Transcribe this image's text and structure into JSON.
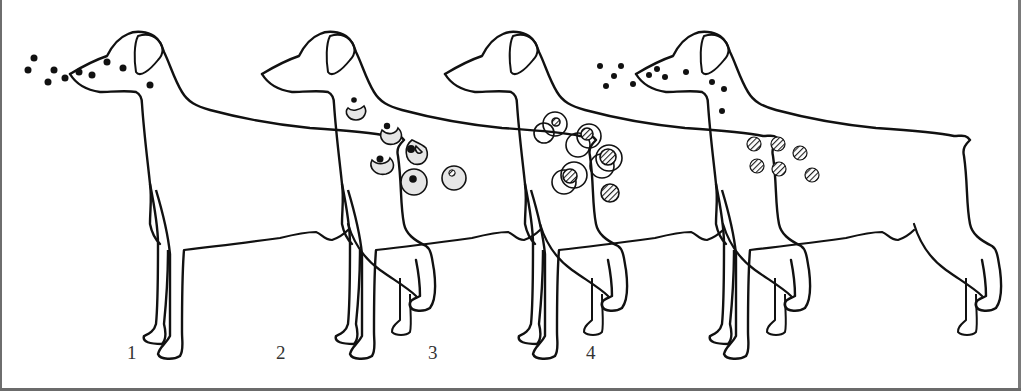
{
  "figure": {
    "stage_labels": [
      "1",
      "2",
      "3",
      "4"
    ],
    "colors": {
      "outline": "#111111",
      "cell_fill": "#e6e6e6",
      "hatch": "#222222",
      "background": "#ffffff"
    },
    "stages": [
      {
        "label": "1",
        "content": "dots (particles) in front of and on the muzzle"
      },
      {
        "label": "2",
        "content": "kidney-shaped cells engulfing dark particles; round cells with nuclei"
      },
      {
        "label": "3",
        "content": "overlapping open circles with hatched spheres"
      },
      {
        "label": "4",
        "content": "particles at muzzle/neck and hatched spheres on body"
      }
    ]
  }
}
